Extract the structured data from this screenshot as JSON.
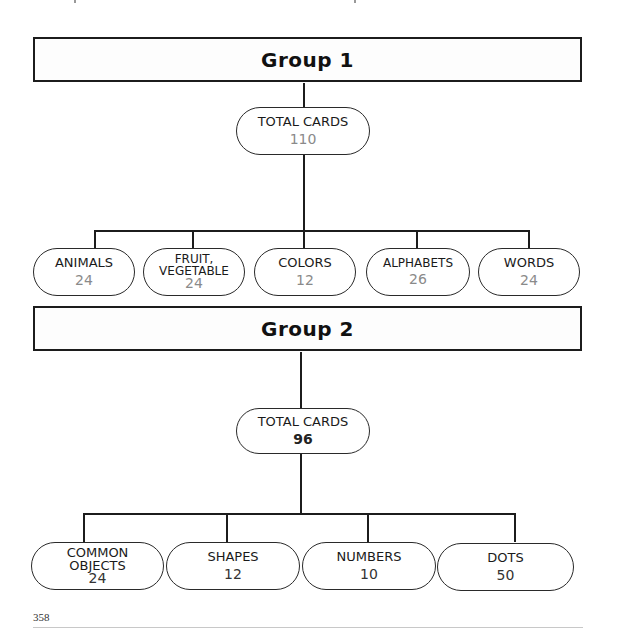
{
  "groups": [
    {
      "title": "Group 1",
      "total": {
        "label": "TOTAL CARDS",
        "count": "110"
      },
      "categories": [
        {
          "label": "ANIMALS",
          "count": "24"
        },
        {
          "label": "FRUIT,\nVEGETABLE",
          "count": "24"
        },
        {
          "label": "COLORS",
          "count": "12"
        },
        {
          "label": "ALPHABETS",
          "count": "26"
        },
        {
          "label": "WORDS",
          "count": "24"
        }
      ]
    },
    {
      "title": "Group 2",
      "total": {
        "label": "TOTAL CARDS",
        "count": "96"
      },
      "categories": [
        {
          "label": "COMMON\nOBJECTS",
          "count": "24"
        },
        {
          "label": "SHAPES",
          "count": "12"
        },
        {
          "label": "NUMBERS",
          "count": "10"
        },
        {
          "label": "DOTS",
          "count": "50"
        }
      ]
    }
  ],
  "footer": {
    "page_number": "358"
  },
  "colors": {
    "line": "#1c1c1c",
    "group1_count": "#8a8a8a",
    "group2_count": "#333333"
  }
}
